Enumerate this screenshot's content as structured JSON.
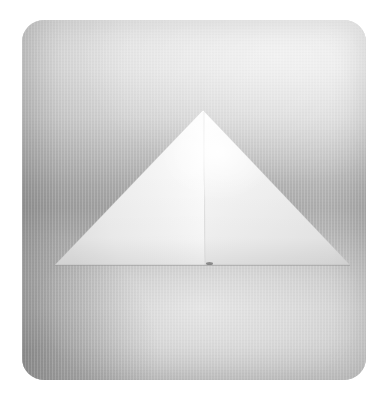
{
  "image": {
    "title": "White paper pyramid on gradient gray backdrop",
    "alt_text": "A folded white paper triangle resembling a pyramid, centered on a softly graduated gray studio backdrop within a rounded square tile",
    "canvas": {
      "width": 387,
      "height": 405,
      "background_color": "#ffffff"
    },
    "tile": {
      "label": "photo-tile",
      "x": 22,
      "y": 20,
      "width": 344,
      "height": 360,
      "corner_radius": 22,
      "backdrop_top_color": "#e9e9e9",
      "backdrop_mid_color": "#a2a2a2",
      "backdrop_bottom_color": "#c6c6c6",
      "shadow_corner_color": "#8f8f8f"
    },
    "subject": {
      "label": "paper-pyramid",
      "shape": "triangle",
      "apex": {
        "x": 203,
        "y": 110
      },
      "base_left": {
        "x": 55,
        "y": 265
      },
      "base_right": {
        "x": 350,
        "y": 265
      },
      "left_face_color": "#efefef",
      "right_face_color": "#e7e7e7",
      "highlight_color": "#ffffff",
      "crease_x": 205,
      "base_width_px": 295,
      "height_px": 155
    },
    "marks": [
      {
        "label": "surface-speck",
        "x": 207,
        "y": 263,
        "color": "#4a4a4a"
      }
    ]
  }
}
